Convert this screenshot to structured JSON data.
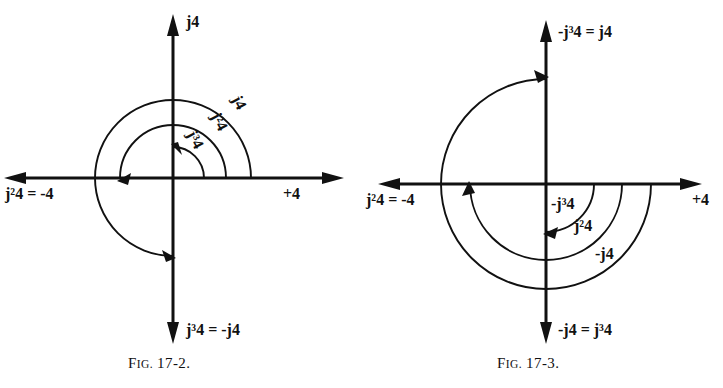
{
  "page": {
    "background": "#ffffff",
    "ink": "#111111",
    "width": 723,
    "height": 388
  },
  "figures": [
    {
      "id": "fig-17-2",
      "caption": "FIG. 17-2.",
      "caption_prefix": "F",
      "caption_smallcaps": "IG.",
      "caption_number": " 17-2.",
      "origin": {
        "x": 173,
        "y": 178
      },
      "rotation_sense": "counterclockwise",
      "axis_labels": {
        "up": {
          "text": "j4",
          "base": "j",
          "exp": "",
          "suffix": "4"
        },
        "right": {
          "text": "+4"
        },
        "left": {
          "text": "j²4 = -4"
        },
        "down": {
          "text": "j³4 = -j4"
        }
      },
      "arcs": [
        {
          "label": "j4",
          "radius": 31,
          "from_deg": 0,
          "to_deg": 90,
          "end": "up"
        },
        {
          "label": "j²4",
          "radius": 53,
          "from_deg": 0,
          "to_deg": 180,
          "end": "left"
        },
        {
          "label": "j³4",
          "radius": 78,
          "from_deg": 0,
          "to_deg": 270,
          "end": "down"
        }
      ],
      "arc_labels": [
        {
          "text": "j4",
          "rot_deg": 62
        },
        {
          "text": "j²4",
          "rot_deg": 62
        },
        {
          "text": "j³4",
          "rot_deg": 62
        }
      ]
    },
    {
      "id": "fig-17-3",
      "caption": "FIG. 17-3.",
      "caption_prefix": "F",
      "caption_smallcaps": "IG.",
      "caption_number": " 17-3.",
      "origin": {
        "x": 546,
        "y": 184
      },
      "rotation_sense": "clockwise",
      "axis_labels": {
        "up": {
          "text": "-j³4 = j4"
        },
        "right": {
          "text": "+4"
        },
        "left": {
          "text": "j²4 = -4"
        },
        "down": {
          "text": "-j4 = j³4"
        }
      },
      "arcs": [
        {
          "label": "-j4",
          "radius": 48,
          "from_deg": 0,
          "to_deg": -90,
          "end": "down"
        },
        {
          "label": "j²4",
          "radius": 76,
          "from_deg": 0,
          "to_deg": -180,
          "end": "left"
        },
        {
          "label": "-j³4",
          "radius": 105,
          "from_deg": 0,
          "to_deg": -270,
          "end": "up"
        }
      ],
      "arc_labels": [
        {
          "text": "-j³4"
        },
        {
          "text": "j²4"
        },
        {
          "text": "-j4"
        }
      ]
    }
  ]
}
